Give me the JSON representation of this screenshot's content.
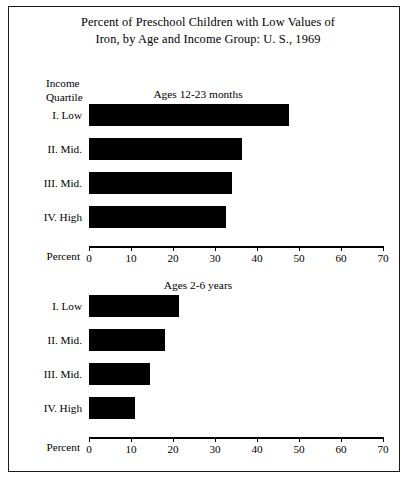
{
  "figure": {
    "title_line1": "Percent of Preschool Children with Low Values of",
    "title_line2": "Iron, by Age and Income Group: U. S., 1969",
    "quartile_header_line1": "Income",
    "quartile_header_line2": "Quartile",
    "axis_title": "Percent",
    "frame_color": "#1a1a1a",
    "bar_color": "#000000"
  },
  "chart_data": [
    {
      "type": "bar",
      "orientation": "horizontal",
      "title": "Ages 12-23 months",
      "xlabel": "Percent",
      "ylabel": "Income Quartile",
      "categories": [
        "I.  Low",
        "II.  Mid.",
        "III.  Mid.",
        "IV.  High"
      ],
      "values": [
        47.5,
        36.5,
        34.0,
        32.5
      ],
      "xlim": [
        0,
        70
      ],
      "xticks": [
        0,
        10,
        20,
        30,
        40,
        50,
        60,
        70
      ],
      "xticklabels": [
        "0",
        "10",
        "20",
        "30",
        "40",
        "50",
        "60",
        "70"
      ],
      "grid": false,
      "legend": false
    },
    {
      "type": "bar",
      "orientation": "horizontal",
      "title": "Ages 2-6 years",
      "xlabel": "Percent",
      "ylabel": "Income Quartile",
      "categories": [
        "I.  Low",
        "II.  Mid.",
        "III.  Mid.",
        "IV.  High"
      ],
      "values": [
        21.5,
        18.0,
        14.5,
        11.0
      ],
      "xlim": [
        0,
        70
      ],
      "xticks": [
        0,
        10,
        20,
        30,
        40,
        50,
        60,
        70
      ],
      "xticklabels": [
        "0",
        "10",
        "20",
        "30",
        "40",
        "50",
        "60",
        "70"
      ],
      "grid": false,
      "legend": false
    }
  ]
}
